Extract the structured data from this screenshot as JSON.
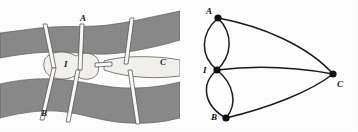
{
  "figure": {
    "background_color": "#ffffff",
    "land_color": "#8a8a8a",
    "island_color": "#f4f2ef",
    "bridge_color": "#fbfaf8",
    "outline_color": "#4a4a4a",
    "graph_color": "#1b1b1b"
  },
  "map": {
    "caption": "bridge map",
    "labels": {
      "a": "A",
      "b": "B",
      "c": "C",
      "i": "I"
    },
    "regions": [
      {
        "id": "a",
        "name": "north-bank",
        "label": "A"
      },
      {
        "id": "b",
        "name": "south-bank",
        "label": "B"
      },
      {
        "id": "c",
        "name": "east-bank",
        "label": "C"
      },
      {
        "id": "i",
        "name": "island",
        "label": "I"
      }
    ],
    "bridges": [
      {
        "id": "b1",
        "from": "A",
        "to": "I"
      },
      {
        "id": "b2",
        "from": "A",
        "to": "I"
      },
      {
        "id": "b3",
        "from": "B",
        "to": "I"
      },
      {
        "id": "b4",
        "from": "B",
        "to": "I"
      },
      {
        "id": "b5",
        "from": "I",
        "to": "C"
      },
      {
        "id": "b6",
        "from": "A",
        "to": "C"
      },
      {
        "id": "b7",
        "from": "B",
        "to": "C"
      }
    ],
    "bridge_count": 7
  },
  "graph": {
    "caption": "multigraph",
    "nodes": [
      {
        "id": "A",
        "label": "A",
        "x": 218,
        "y": 18,
        "label_x": 207,
        "label_y": 13
      },
      {
        "id": "I",
        "label": "I",
        "x": 217,
        "y": 70,
        "label_x": 204,
        "label_y": 73
      },
      {
        "id": "B",
        "label": "B",
        "x": 226,
        "y": 118,
        "label_x": 212,
        "label_y": 119
      },
      {
        "id": "C",
        "label": "C",
        "x": 333,
        "y": 74,
        "label_x": 338,
        "label_y": 86
      }
    ],
    "edges": [
      {
        "id": "e1",
        "from": "A",
        "to": "I",
        "style": "curve-left"
      },
      {
        "id": "e2",
        "from": "A",
        "to": "I",
        "style": "curve-right"
      },
      {
        "id": "e3",
        "from": "B",
        "to": "I",
        "style": "curve-left"
      },
      {
        "id": "e4",
        "from": "B",
        "to": "I",
        "style": "curve-right"
      },
      {
        "id": "e5",
        "from": "I",
        "to": "C",
        "style": "slight-curve"
      },
      {
        "id": "e6",
        "from": "A",
        "to": "C",
        "style": "curve"
      },
      {
        "id": "e7",
        "from": "B",
        "to": "C",
        "style": "curve"
      }
    ],
    "edge_count": 7,
    "node_count": 4
  }
}
